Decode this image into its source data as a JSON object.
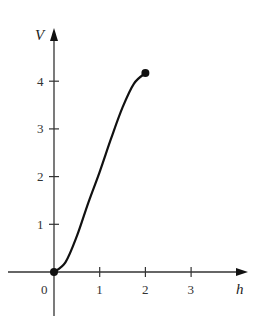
{
  "chart_data": {
    "type": "line",
    "title": "",
    "xlabel": "h",
    "ylabel": "V",
    "xlim": [
      -0.6,
      4.1
    ],
    "ylim": [
      -0.9,
      5.1
    ],
    "grid": false,
    "legend": null,
    "origin_label": "0",
    "x_ticks": [
      1,
      2,
      3
    ],
    "x_tick_labels": [
      "1",
      "2",
      "3"
    ],
    "y_ticks": [
      1,
      2,
      3,
      4
    ],
    "y_tick_labels": [
      "1",
      "2",
      "3",
      "4"
    ],
    "series": [
      {
        "name": "V(h)",
        "x": [
          0,
          0.25,
          0.5,
          0.75,
          1.0,
          1.25,
          1.5,
          1.75,
          2.0
        ],
        "y": [
          0,
          0.2,
          0.75,
          1.45,
          2.1,
          2.8,
          3.45,
          3.95,
          4.17
        ],
        "color": "#111111"
      }
    ],
    "markers": [
      {
        "x": 0,
        "y": 0,
        "style": "filled-dot"
      },
      {
        "x": 2,
        "y": 4.17,
        "style": "filled-dot"
      }
    ]
  },
  "colors": {
    "axis": "#333333",
    "curve": "#111111"
  }
}
